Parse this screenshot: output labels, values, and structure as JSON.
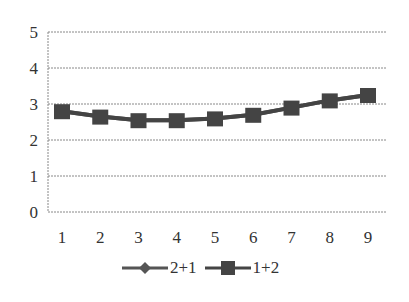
{
  "chart_data": {
    "type": "line",
    "title": "",
    "xlabel": "",
    "ylabel": "",
    "x": [
      1,
      2,
      3,
      4,
      5,
      6,
      7,
      8,
      9
    ],
    "categories": [
      "1",
      "2",
      "3",
      "4",
      "5",
      "6",
      "7",
      "8",
      "9"
    ],
    "ylim": [
      0,
      5
    ],
    "yticks": [
      0,
      1,
      2,
      3,
      4,
      5
    ],
    "grid": true,
    "legend_position": "bottom",
    "series": [
      {
        "name": "2+1",
        "marker": "diamond",
        "color": "#555555",
        "values": [
          2.8,
          2.65,
          2.55,
          2.55,
          2.6,
          2.7,
          2.9,
          3.1,
          3.25
        ]
      },
      {
        "name": "1+2",
        "marker": "square",
        "color": "#444444",
        "values": [
          2.8,
          2.65,
          2.55,
          2.55,
          2.6,
          2.7,
          2.9,
          3.1,
          3.25
        ]
      }
    ]
  },
  "legend": {
    "items": [
      {
        "label": "2+1",
        "marker": "diamond-icon"
      },
      {
        "label": "1+2",
        "marker": "square-icon"
      }
    ]
  }
}
